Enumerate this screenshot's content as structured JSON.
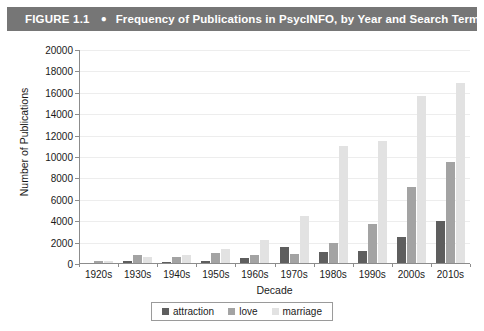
{
  "figure": {
    "number": "FIGURE 1.1",
    "bullet": "●",
    "title": "Frequency of Publications in PsycINFO, by Year and Search Term",
    "header_bg": "#767676",
    "header_text_color": "#ffffff"
  },
  "chart_data": {
    "type": "bar",
    "title": "Frequency of Publications in PsycINFO, by Year and Search Term",
    "xlabel": "Decade",
    "ylabel": "Number of Publications",
    "ylim": [
      0,
      20000
    ],
    "ytick_step": 2000,
    "yticks": [
      0,
      2000,
      4000,
      6000,
      8000,
      10000,
      12000,
      14000,
      16000,
      18000,
      20000
    ],
    "ytick_labels": [
      "0",
      "2000",
      "4000",
      "6000",
      "8000",
      "10000",
      "12000",
      "14000",
      "16000",
      "18000",
      "20000"
    ],
    "grid": true,
    "legend_position": "bottom",
    "categories": [
      "1920s",
      "1930s",
      "1940s",
      "1950s",
      "1960s",
      "1970s",
      "1980s",
      "1990s",
      "2000s",
      "2010s"
    ],
    "series": [
      {
        "name": "attraction",
        "color": "#5e5e5e",
        "values": [
          100,
          250,
          200,
          250,
          600,
          1600,
          1100,
          1200,
          2500,
          4000
        ]
      },
      {
        "name": "love",
        "color": "#a3a3a3",
        "values": [
          300,
          800,
          700,
          1000,
          800,
          900,
          2000,
          3700,
          7200,
          9500
        ]
      },
      {
        "name": "marriage",
        "color": "#e2e2e2",
        "values": [
          250,
          700,
          800,
          1400,
          2200,
          4500,
          11000,
          11500,
          15700,
          16900
        ]
      }
    ]
  }
}
